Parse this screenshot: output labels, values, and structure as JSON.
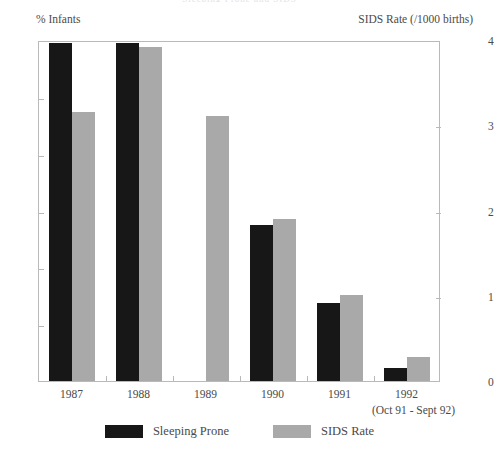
{
  "chart_data": {
    "type": "bar",
    "title": "Sleeping Prone and SIDS",
    "categories": [
      "1987",
      "1988",
      "1989",
      "1990",
      "1991",
      "1992"
    ],
    "category_sublabel": "(Oct 91 - Sept 92)",
    "series": [
      {
        "name": "Sleeping Prone",
        "axis": "left",
        "color": "#171717",
        "values": [
          59.4,
          59.4,
          null,
          27.5,
          13.7,
          2.3
        ]
      },
      {
        "name": "SIDS Rate",
        "axis": "right",
        "color": "#a9a9a9",
        "values": [
          3.15,
          3.92,
          3.11,
          1.9,
          1.01,
          0.28
        ]
      }
    ],
    "xlabel": "",
    "ylabel": "% Infants",
    "ylabel_right": "SIDS Rate (/1000 births)",
    "ylim": [
      0,
      60
    ],
    "ylim_right": [
      0,
      4
    ],
    "yticks": [
      0,
      10,
      20,
      30,
      40,
      50,
      60
    ],
    "yticks_right": [
      0,
      1,
      2,
      3,
      4
    ],
    "grid": false,
    "legend_position": "bottom"
  },
  "axes": {
    "left_caption": "% Infants",
    "right_caption": "SIDS Rate (/1000 births)",
    "left_ticks": [
      "0",
      "10",
      "20",
      "30",
      "40",
      "50",
      "60"
    ],
    "right_ticks": [
      "0",
      "1",
      "2",
      "3",
      "4"
    ]
  },
  "xaxis": {
    "categories": [
      "1987",
      "1988",
      "1989",
      "1990",
      "1991",
      "1992"
    ],
    "sublabel": "(Oct 91 - Sept 92)"
  },
  "legend": {
    "items": [
      {
        "label": "Sleeping Prone",
        "color": "#171717"
      },
      {
        "label": "SIDS Rate",
        "color": "#a9a9a9"
      }
    ]
  },
  "title": "Sleeping Prone and SIDS"
}
